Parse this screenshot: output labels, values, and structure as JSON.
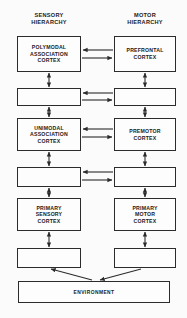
{
  "diagram": {
    "title_sensory": "SENSORY\nHIERARCHY",
    "title_motor": "MOTOR\nHIERARCHY",
    "columns": [
      {
        "name": "sensory",
        "header": "SENSORY\nHIERARCHY",
        "header_x": 17,
        "header_y": 12,
        "header_w": 64,
        "nodes": [
          {
            "id": "polymodal-association-cortex",
            "label": "POLYMODAL\nASSOCIATION\nCORTEX",
            "x": 17,
            "y": 36,
            "w": 64,
            "h": 36
          },
          {
            "id": "sensory-relay-1",
            "label": "",
            "x": 17,
            "y": 88,
            "w": 64,
            "h": 18
          },
          {
            "id": "unimodal-association-cortex",
            "label": "UNIMODAL\nASSOCIATION\nCORTEX",
            "x": 17,
            "y": 118,
            "w": 64,
            "h": 33
          },
          {
            "id": "sensory-relay-2",
            "label": "",
            "x": 17,
            "y": 167,
            "w": 64,
            "h": 20
          },
          {
            "id": "primary-sensory-cortex",
            "label": "PRIMARY\nSENSORY\nCORTEX",
            "x": 17,
            "y": 198,
            "w": 64,
            "h": 33
          },
          {
            "id": "sensory-relay-3",
            "label": "",
            "x": 17,
            "y": 248,
            "w": 64,
            "h": 20
          }
        ]
      },
      {
        "name": "motor",
        "header": "MOTOR\nHIERARCHY",
        "header_x": 114,
        "header_y": 12,
        "header_w": 62,
        "nodes": [
          {
            "id": "prefrontal-cortex",
            "label": "PREFRONTAL\nCORTEX",
            "x": 114,
            "y": 36,
            "w": 62,
            "h": 36
          },
          {
            "id": "motor-relay-1",
            "label": "",
            "x": 114,
            "y": 88,
            "w": 62,
            "h": 18
          },
          {
            "id": "premotor-cortex",
            "label": "PREMOTOR\nCORTEX",
            "x": 114,
            "y": 118,
            "w": 62,
            "h": 33
          },
          {
            "id": "motor-relay-2",
            "label": "",
            "x": 114,
            "y": 167,
            "w": 62,
            "h": 20
          },
          {
            "id": "primary-motor-cortex",
            "label": "PRIMARY\nMOTOR\nCORTEX",
            "x": 114,
            "y": 198,
            "w": 62,
            "h": 33
          },
          {
            "id": "motor-relay-3",
            "label": "",
            "x": 114,
            "y": 248,
            "w": 62,
            "h": 20
          }
        ]
      }
    ],
    "environment": {
      "id": "environment",
      "label": "ENVIRONMENT",
      "x": 18,
      "y": 281,
      "w": 152,
      "h": 22
    },
    "vertical_arrows": [
      {
        "id": "sensory-v1",
        "x": 49,
        "y1": 72,
        "y2": 88
      },
      {
        "id": "sensory-v2",
        "x": 49,
        "y1": 106,
        "y2": 118
      },
      {
        "id": "sensory-v3",
        "x": 49,
        "y1": 151,
        "y2": 167
      },
      {
        "id": "sensory-v4",
        "x": 49,
        "y1": 187,
        "y2": 198
      },
      {
        "id": "sensory-v5",
        "x": 49,
        "y1": 231,
        "y2": 248
      },
      {
        "id": "motor-v1",
        "x": 145,
        "y1": 72,
        "y2": 88
      },
      {
        "id": "motor-v2",
        "x": 145,
        "y1": 106,
        "y2": 118
      },
      {
        "id": "motor-v3",
        "x": 145,
        "y1": 151,
        "y2": 167
      },
      {
        "id": "motor-v4",
        "x": 145,
        "y1": 187,
        "y2": 198
      },
      {
        "id": "motor-v5",
        "x": 145,
        "y1": 231,
        "y2": 248
      }
    ],
    "horizontal_arrow_pairs": [
      {
        "id": "link-polymodal-prefrontal",
        "x1": 81,
        "x2": 114,
        "y_top": 50,
        "y_bottom": 58
      },
      {
        "id": "link-relay1",
        "x1": 81,
        "x2": 114,
        "y_top": 93,
        "y_bottom": 100
      },
      {
        "id": "link-unimodal-premotor",
        "x1": 81,
        "x2": 114,
        "y_top": 129,
        "y_bottom": 137
      },
      {
        "id": "link-relay2",
        "x1": 81,
        "x2": 114,
        "y_top": 172,
        "y_bottom": 180
      }
    ],
    "diagonal_arrows": [
      {
        "id": "environment-to-sensory",
        "x1": 92,
        "y1": 281,
        "x2": 50,
        "y2": 268,
        "direction": "up-left"
      },
      {
        "id": "motor-to-environment",
        "x1": 140,
        "y1": 268,
        "x2": 100,
        "y2": 281,
        "direction": "down-left"
      }
    ],
    "colors": {
      "stroke": "#2b2b2b",
      "text": "#1a1a1a",
      "background": "#fbfbfb",
      "node_fill": "#fdfdfd"
    }
  }
}
